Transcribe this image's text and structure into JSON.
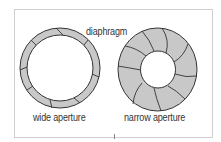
{
  "diagram": {
    "title_label": "diaphragm",
    "left": {
      "label": "wide aperture",
      "outer_radius": 40,
      "inner_radius": 33
    },
    "right": {
      "label": "narrow aperture",
      "outer_radius": 40,
      "inner_radius": 17.5
    }
  },
  "colors": {
    "blade_fill": "#c8c8c8",
    "outline": "#333333",
    "frame": "#cfcfcf",
    "background": "#ffffff"
  }
}
